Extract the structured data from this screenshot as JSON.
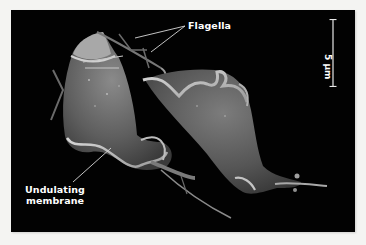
{
  "figure": {
    "background_color": "#020202",
    "page_color": "#f4f4f2",
    "labels": {
      "flagella": "Flagella",
      "undulating_membrane_line1": "Undulating",
      "undulating_membrane_line2": "membrane"
    },
    "scale_bar": {
      "value": "5 µm",
      "orientation": "vertical"
    }
  }
}
